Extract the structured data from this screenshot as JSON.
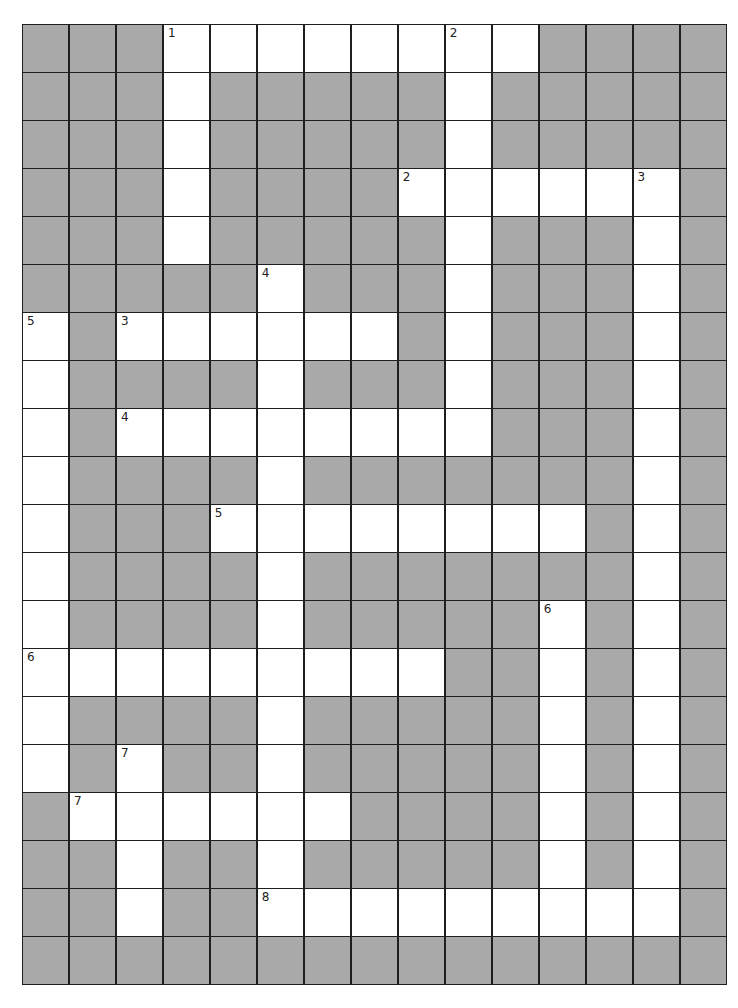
{
  "puzzle": {
    "columns": 15,
    "rows": 20,
    "colors": {
      "block": "#a9a9a9",
      "open": "#ffffff",
      "line": "#1e1e1e"
    },
    "grid": [
      "...########....",
      "...#.....#.....",
      "...#.....#.....",
      "...#....######.",
      "...#.....#...#.",
      ".....#...#...#.",
      "#.######.#...#.",
      "#....#...#...#.",
      "#.########...#.",
      "#....#.......#.",
      "#...########.#.",
      "#....#.....#.#.",
      "#....#.....#.#.",
      "#########..#.#.",
      "#....#.....#.#.",
      "#.#..#.....#.#.",
      ".######....#.#.",
      "..#..#.....#.#.",
      "..#..#########.",
      "..............."
    ],
    "numbers": [
      {
        "row": 0,
        "col": 3,
        "label": "1"
      },
      {
        "row": 0,
        "col": 9,
        "label": "2"
      },
      {
        "row": 3,
        "col": 8,
        "label": "2"
      },
      {
        "row": 3,
        "col": 13,
        "label": "3"
      },
      {
        "row": 5,
        "col": 5,
        "label": "4"
      },
      {
        "row": 6,
        "col": 0,
        "label": "5"
      },
      {
        "row": 6,
        "col": 2,
        "label": "3"
      },
      {
        "row": 8,
        "col": 2,
        "label": "4"
      },
      {
        "row": 10,
        "col": 4,
        "label": "5"
      },
      {
        "row": 12,
        "col": 11,
        "label": "6"
      },
      {
        "row": 13,
        "col": 0,
        "label": "6"
      },
      {
        "row": 15,
        "col": 2,
        "label": "7"
      },
      {
        "row": 16,
        "col": 1,
        "label": "7"
      },
      {
        "row": 18,
        "col": 5,
        "label": "8"
      }
    ],
    "entries": {
      "across": [
        {
          "label": "1",
          "row": 0,
          "col": 3,
          "length": 8
        },
        {
          "label": "2",
          "row": 3,
          "col": 8,
          "length": 6
        },
        {
          "label": "3",
          "row": 6,
          "col": 2,
          "length": 6
        },
        {
          "label": "4",
          "row": 8,
          "col": 2,
          "length": 8
        },
        {
          "label": "5",
          "row": 10,
          "col": 4,
          "length": 8
        },
        {
          "label": "6",
          "row": 13,
          "col": 0,
          "length": 9
        },
        {
          "label": "7",
          "row": 16,
          "col": 1,
          "length": 6
        },
        {
          "label": "8",
          "row": 18,
          "col": 5,
          "length": 9
        }
      ],
      "down": [
        {
          "label": "1",
          "row": 0,
          "col": 3,
          "length": 5
        },
        {
          "label": "2",
          "row": 0,
          "col": 9,
          "length": 9
        },
        {
          "label": "3",
          "row": 3,
          "col": 13,
          "length": 16
        },
        {
          "label": "4",
          "row": 5,
          "col": 5,
          "length": 14
        },
        {
          "label": "5",
          "row": 6,
          "col": 0,
          "length": 10
        },
        {
          "label": "6",
          "row": 12,
          "col": 11,
          "length": 7
        },
        {
          "label": "7",
          "row": 15,
          "col": 2,
          "length": 4
        }
      ]
    }
  }
}
